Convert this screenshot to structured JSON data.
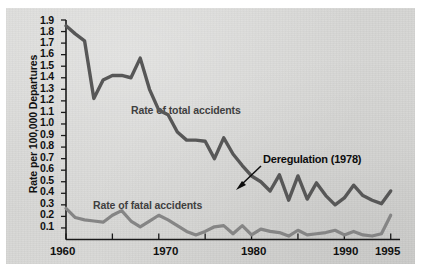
{
  "chart_data": {
    "type": "line",
    "title": "",
    "subtitle": "",
    "xlabel": "",
    "ylabel": "Rate per 100,000 Departures",
    "xlim": [
      1960,
      1996
    ],
    "ylim": [
      0.0,
      1.9
    ],
    "grid": false,
    "legend_position": "inline-labels",
    "x_ticks_labeled": [
      "1960",
      "1970",
      "1980",
      "1990",
      "1995"
    ],
    "x_ticks_all": [
      1960,
      1965,
      1970,
      1975,
      1980,
      1985,
      1990,
      1995
    ],
    "y_ticks": [
      "1.9",
      "1.8",
      "1.7",
      "1.6",
      "1.5",
      "1.4",
      "1.3",
      "1.2",
      "1.1",
      "1.0",
      "0.9",
      "0.8",
      "0.7",
      "0.6",
      "0.5",
      "0.4",
      "0.3",
      "0.2",
      "0.1"
    ],
    "x": [
      1960,
      1961,
      1962,
      1963,
      1964,
      1965,
      1966,
      1967,
      1968,
      1969,
      1970,
      1971,
      1972,
      1973,
      1974,
      1975,
      1976,
      1977,
      1978,
      1979,
      1980,
      1981,
      1982,
      1983,
      1984,
      1985,
      1986,
      1987,
      1988,
      1989,
      1990,
      1991,
      1992,
      1993,
      1994,
      1995
    ],
    "series": [
      {
        "name": "Rate of total accidents",
        "color": "#575757",
        "values": [
          1.85,
          1.78,
          1.72,
          1.22,
          1.38,
          1.42,
          1.42,
          1.4,
          1.57,
          1.3,
          1.12,
          1.08,
          0.93,
          0.86,
          0.86,
          0.85,
          0.7,
          0.88,
          0.74,
          0.64,
          0.55,
          0.5,
          0.42,
          0.56,
          0.34,
          0.55,
          0.35,
          0.49,
          0.38,
          0.3,
          0.36,
          0.47,
          0.38,
          0.34,
          0.31,
          0.42
        ]
      },
      {
        "name": "Rate of fatal accidents",
        "color": "#858585",
        "values": [
          0.27,
          0.19,
          0.17,
          0.16,
          0.15,
          0.21,
          0.25,
          0.16,
          0.11,
          0.16,
          0.21,
          0.17,
          0.12,
          0.07,
          0.04,
          0.07,
          0.11,
          0.12,
          0.05,
          0.12,
          0.04,
          0.09,
          0.07,
          0.06,
          0.03,
          0.08,
          0.04,
          0.05,
          0.06,
          0.08,
          0.04,
          0.07,
          0.04,
          0.03,
          0.05,
          0.21
        ]
      }
    ],
    "annotations": [
      {
        "name": "deregulation",
        "text": "Deregulation (1978)",
        "target_x": 1978,
        "target_y": 0.62
      }
    ]
  },
  "axis": {
    "y_title": "Rate per 100,000 Departures",
    "y_labels": [
      "1.9",
      "1.8",
      "1.7",
      "1.6",
      "1.5",
      "1.4",
      "1.3",
      "1.2",
      "1.1",
      "1.0",
      "0.9",
      "0.8",
      "0.7",
      "0.6",
      "0.5",
      "0.4",
      "0.3",
      "0.2",
      "0.1"
    ],
    "x_labels": [
      "1960",
      "1970",
      "1980",
      "1990",
      "1995"
    ]
  },
  "labels": {
    "total_series": "Rate of total accidents",
    "fatal_series": "Rate of fatal accidents",
    "annotation": "Deregulation (1978)"
  },
  "colors": {
    "total_line": "#575757",
    "fatal_line": "#858585",
    "axis": "#1a1a1a",
    "paper": "#d7d7d5",
    "text": "#111111"
  }
}
